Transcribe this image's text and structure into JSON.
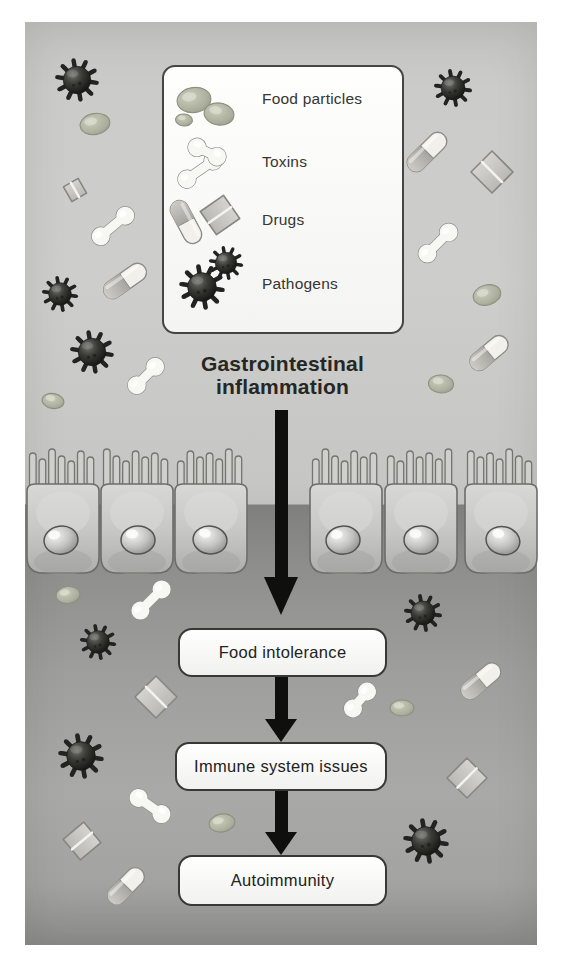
{
  "title": {
    "line1": "Gastrointestinal",
    "line2": "inflammation"
  },
  "legend": {
    "items": [
      {
        "label": "Food particles",
        "icon": "food-particles-icon",
        "label_y": 32,
        "parts": [
          {
            "t": "blob",
            "x": 30,
            "y": 33,
            "s": 36,
            "h": 27,
            "r": -8
          },
          {
            "t": "blob",
            "x": 20,
            "y": 53,
            "s": 19,
            "h": 14,
            "r": 6
          },
          {
            "t": "blob",
            "x": 55,
            "y": 47,
            "s": 32,
            "h": 24,
            "r": 8
          }
        ]
      },
      {
        "label": "Toxins",
        "icon": "toxins-icon",
        "label_y": 95,
        "parts": [
          {
            "t": "bone",
            "x": 36,
            "y": 103,
            "s": 52,
            "r": -35
          },
          {
            "t": "bone",
            "x": 43,
            "y": 85,
            "s": 42,
            "r": 25
          }
        ]
      },
      {
        "label": "Drugs",
        "icon": "drugs-icon",
        "label_y": 153,
        "parts": [
          {
            "t": "capsule",
            "x": 22,
            "y": 155,
            "s": 48,
            "r": 62
          },
          {
            "t": "diamond",
            "x": 56,
            "y": 148,
            "s": 40,
            "r": 100
          }
        ]
      },
      {
        "label": "Pathogens",
        "icon": "pathogens-icon",
        "label_y": 217,
        "parts": [
          {
            "t": "pathogen",
            "x": 62,
            "y": 196,
            "s": 36,
            "r": 0
          },
          {
            "t": "pathogen",
            "x": 38,
            "y": 220,
            "s": 48,
            "r": 0
          }
        ]
      }
    ]
  },
  "flow": {
    "boxes": [
      {
        "label": "Food intolerance"
      },
      {
        "label": "Immune system issues"
      },
      {
        "label": "Autoimmunity"
      }
    ]
  },
  "cells": {
    "count": 6,
    "x": [
      0,
      74,
      148,
      283,
      358,
      438
    ],
    "top": 421,
    "seeds": [
      0,
      2,
      4,
      1,
      3,
      5
    ],
    "nucleus_offsets": [
      -1,
      2,
      0,
      -2,
      1,
      3
    ]
  },
  "scatter": [
    {
      "t": "pathogen",
      "x": 52,
      "y": 58,
      "s": 46,
      "r": 0
    },
    {
      "t": "blob",
      "x": 70,
      "y": 102,
      "s": 32,
      "h": 23,
      "r": -10
    },
    {
      "t": "diamond",
      "x": 50,
      "y": 168,
      "s": 24,
      "r": 15
    },
    {
      "t": "bone",
      "x": 88,
      "y": 204,
      "s": 52,
      "r": -40
    },
    {
      "t": "pathogen",
      "x": 35,
      "y": 272,
      "s": 38,
      "r": 0
    },
    {
      "t": "capsule",
      "x": 100,
      "y": 259,
      "s": 50,
      "r": -35
    },
    {
      "t": "pathogen",
      "x": 67,
      "y": 330,
      "s": 46,
      "r": 0
    },
    {
      "t": "bone",
      "x": 121,
      "y": 354,
      "s": 46,
      "r": -45
    },
    {
      "t": "blob",
      "x": 28,
      "y": 379,
      "s": 24,
      "h": 17,
      "r": 10
    },
    {
      "t": "pathogen",
      "x": 428,
      "y": 66,
      "s": 40,
      "r": 0
    },
    {
      "t": "capsule",
      "x": 402,
      "y": 130,
      "s": 50,
      "r": -45
    },
    {
      "t": "diamond",
      "x": 467,
      "y": 150,
      "s": 42,
      "r": 0
    },
    {
      "t": "bone",
      "x": 413,
      "y": 221,
      "s": 50,
      "r": -45
    },
    {
      "t": "blob",
      "x": 462,
      "y": 273,
      "s": 30,
      "h": 22,
      "r": -15
    },
    {
      "t": "capsule",
      "x": 464,
      "y": 331,
      "s": 46,
      "r": -40
    },
    {
      "t": "blob",
      "x": 416,
      "y": 362,
      "s": 27,
      "h": 20,
      "r": 5
    },
    {
      "t": "blob",
      "x": 43,
      "y": 573,
      "s": 26,
      "h": 19,
      "r": -5
    },
    {
      "t": "bone",
      "x": 126,
      "y": 578,
      "s": 50,
      "r": -45
    },
    {
      "t": "pathogen",
      "x": 73,
      "y": 620,
      "s": 38,
      "r": 0
    },
    {
      "t": "diamond",
      "x": 131,
      "y": 675,
      "s": 42,
      "r": 0
    },
    {
      "t": "pathogen",
      "x": 56,
      "y": 734,
      "s": 48,
      "r": 0
    },
    {
      "t": "bone",
      "x": 125,
      "y": 784,
      "s": 48,
      "r": 35
    },
    {
      "t": "diamond",
      "x": 57,
      "y": 819,
      "s": 38,
      "r": 95
    },
    {
      "t": "capsule",
      "x": 101,
      "y": 864,
      "s": 46,
      "r": -45
    },
    {
      "t": "blob",
      "x": 197,
      "y": 801,
      "s": 28,
      "h": 20,
      "r": -10
    },
    {
      "t": "bone",
      "x": 335,
      "y": 678,
      "s": 42,
      "r": -50
    },
    {
      "t": "pathogen",
      "x": 398,
      "y": 591,
      "s": 40,
      "r": 0
    },
    {
      "t": "capsule",
      "x": 456,
      "y": 659,
      "s": 48,
      "r": -40
    },
    {
      "t": "blob",
      "x": 377,
      "y": 686,
      "s": 26,
      "h": 18,
      "r": 0
    },
    {
      "t": "diamond",
      "x": 442,
      "y": 756,
      "s": 40,
      "r": 90
    },
    {
      "t": "pathogen",
      "x": 401,
      "y": 819,
      "s": 48,
      "r": 0
    }
  ],
  "palette": {
    "bg_upper": "#c9c9c7",
    "bg_lower": "#9e9e9c",
    "arrow": "#0f0f0d",
    "box_border": "#383834",
    "box_fill": "#ffffff",
    "text": "#262624",
    "pathogen": "#232321",
    "toxin": "#f7f7f3",
    "drug": "#c9c7c1",
    "food": "#b0b2a2"
  }
}
